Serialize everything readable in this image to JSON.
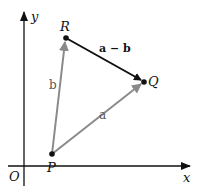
{
  "diagram": {
    "axes": {
      "x_label": "x",
      "y_label": "y",
      "origin_label": "O"
    },
    "points": [
      {
        "label": "P",
        "x": 52,
        "y": 154
      },
      {
        "label": "Q",
        "x": 144,
        "y": 82
      },
      {
        "label": "R",
        "x": 66,
        "y": 38
      }
    ],
    "vectors": [
      {
        "label": "a",
        "from": "P",
        "to": "Q",
        "color": "#8a8a8a"
      },
      {
        "label": "b",
        "from": "P",
        "to": "R",
        "color": "#8a8a8a"
      },
      {
        "label": "a − b",
        "from": "R",
        "to": "Q",
        "color": "#111111"
      }
    ]
  }
}
